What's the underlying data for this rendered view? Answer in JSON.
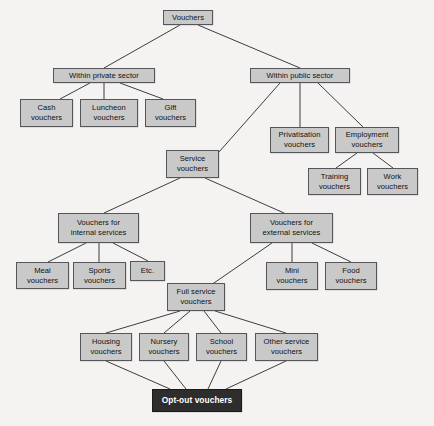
{
  "diagram": {
    "type": "tree-diagram",
    "colors": {
      "background": "#f4f3f1",
      "node_fill": "#c9c9c9",
      "node_border": "#55565a",
      "node_text": "#101010",
      "highlight_fill": "#2e2d2d",
      "highlight_text": "#ffffff",
      "edge": "#3d3d3d"
    },
    "nodes": [
      {
        "id": "vouchers",
        "label": "Vouchers",
        "x": 163,
        "y": 10,
        "w": 50,
        "h": 15,
        "style": "default"
      },
      {
        "id": "private",
        "label": "Within private sector",
        "x": 53,
        "y": 68,
        "w": 102,
        "h": 15,
        "style": "default"
      },
      {
        "id": "public",
        "label": "Within public sector",
        "x": 250,
        "y": 68,
        "w": 100,
        "h": 15,
        "style": "default"
      },
      {
        "id": "cash",
        "label": "Cash\nvouchers",
        "x": 20,
        "y": 99,
        "w": 53,
        "h": 28,
        "style": "default"
      },
      {
        "id": "luncheon",
        "label": "Luncheon\nvouchers",
        "x": 80,
        "y": 99,
        "w": 58,
        "h": 28,
        "style": "default"
      },
      {
        "id": "gift",
        "label": "Gift\nvouchers",
        "x": 145,
        "y": 99,
        "w": 51,
        "h": 28,
        "style": "default"
      },
      {
        "id": "privatisation",
        "label": "Privatisation\nvouchers",
        "x": 270,
        "y": 127,
        "w": 59,
        "h": 26,
        "style": "default"
      },
      {
        "id": "employment",
        "label": "Employment\nvouchers",
        "x": 335,
        "y": 127,
        "w": 64,
        "h": 26,
        "style": "default"
      },
      {
        "id": "training",
        "label": "Training\nvouchers",
        "x": 308,
        "y": 168,
        "w": 53,
        "h": 27,
        "style": "default"
      },
      {
        "id": "work",
        "label": "Work\nvouchers",
        "x": 367,
        "y": 168,
        "w": 51,
        "h": 27,
        "style": "default"
      },
      {
        "id": "service",
        "label": "Service\nvouchers",
        "x": 166,
        "y": 150,
        "w": 53,
        "h": 28,
        "style": "default"
      },
      {
        "id": "internal",
        "label": "Vouchers for\ninternal services",
        "x": 58,
        "y": 213,
        "w": 81,
        "h": 30,
        "style": "default"
      },
      {
        "id": "external",
        "label": "Vouchers for\nexternal services",
        "x": 250,
        "y": 213,
        "w": 83,
        "h": 30,
        "style": "default"
      },
      {
        "id": "meal",
        "label": "Meal\nvouchers",
        "x": 16,
        "y": 262,
        "w": 53,
        "h": 27,
        "style": "default"
      },
      {
        "id": "sports",
        "label": "Sports\nvouchers",
        "x": 73,
        "y": 262,
        "w": 53,
        "h": 27,
        "style": "default"
      },
      {
        "id": "etc",
        "label": "Etc.",
        "x": 130,
        "y": 261,
        "w": 35,
        "h": 20,
        "style": "default"
      },
      {
        "id": "mini",
        "label": "Mini\nvouchers",
        "x": 266,
        "y": 262,
        "w": 52,
        "h": 28,
        "style": "default"
      },
      {
        "id": "food",
        "label": "Food\nvouchers",
        "x": 325,
        "y": 262,
        "w": 52,
        "h": 28,
        "style": "default"
      },
      {
        "id": "fullservice",
        "label": "Full service\nvouchers",
        "x": 167,
        "y": 283,
        "w": 58,
        "h": 28,
        "style": "default"
      },
      {
        "id": "housing",
        "label": "Housing\nvouchers",
        "x": 80,
        "y": 333,
        "w": 52,
        "h": 28,
        "style": "default"
      },
      {
        "id": "nursery",
        "label": "Nursery\nvouchers",
        "x": 139,
        "y": 333,
        "w": 50,
        "h": 28,
        "style": "default"
      },
      {
        "id": "school",
        "label": "School\nvouchers",
        "x": 196,
        "y": 333,
        "w": 51,
        "h": 28,
        "style": "default"
      },
      {
        "id": "otherservice",
        "label": "Other service\nvouchers",
        "x": 255,
        "y": 333,
        "w": 63,
        "h": 28,
        "style": "default"
      },
      {
        "id": "optout",
        "label": "Opt-out vouchers",
        "x": 152,
        "y": 389,
        "w": 90,
        "h": 23,
        "style": "highlight"
      }
    ],
    "edges": [
      {
        "from": "vouchers",
        "to": "private",
        "x1": 180,
        "y1": 25,
        "x2": 104,
        "y2": 68
      },
      {
        "from": "vouchers",
        "to": "public",
        "x1": 198,
        "y1": 25,
        "x2": 300,
        "y2": 68
      },
      {
        "from": "private",
        "to": "cash",
        "x1": 90,
        "y1": 83,
        "x2": 60,
        "y2": 99
      },
      {
        "from": "private",
        "to": "luncheon",
        "x1": 104,
        "y1": 83,
        "x2": 104,
        "y2": 99
      },
      {
        "from": "private",
        "to": "gift",
        "x1": 120,
        "y1": 83,
        "x2": 163,
        "y2": 99
      },
      {
        "from": "public",
        "to": "service",
        "x1": 280,
        "y1": 83,
        "x2": 219,
        "y2": 152
      },
      {
        "from": "public",
        "to": "privatisation",
        "x1": 300,
        "y1": 83,
        "x2": 300,
        "y2": 127
      },
      {
        "from": "public",
        "to": "employment",
        "x1": 318,
        "y1": 83,
        "x2": 363,
        "y2": 127
      },
      {
        "from": "employment",
        "to": "training",
        "x1": 357,
        "y1": 153,
        "x2": 336,
        "y2": 168
      },
      {
        "from": "employment",
        "to": "work",
        "x1": 373,
        "y1": 153,
        "x2": 393,
        "y2": 168
      },
      {
        "from": "service",
        "to": "internal",
        "x1": 180,
        "y1": 178,
        "x2": 104,
        "y2": 213
      },
      {
        "from": "service",
        "to": "external",
        "x1": 205,
        "y1": 178,
        "x2": 284,
        "y2": 213
      },
      {
        "from": "internal",
        "to": "meal",
        "x1": 86,
        "y1": 243,
        "x2": 48,
        "y2": 262
      },
      {
        "from": "internal",
        "to": "sports",
        "x1": 99,
        "y1": 243,
        "x2": 99,
        "y2": 262
      },
      {
        "from": "internal",
        "to": "etc",
        "x1": 113,
        "y1": 243,
        "x2": 148,
        "y2": 261
      },
      {
        "from": "external",
        "to": "fullservice",
        "x1": 272,
        "y1": 243,
        "x2": 211,
        "y2": 285
      },
      {
        "from": "external",
        "to": "mini",
        "x1": 292,
        "y1": 243,
        "x2": 292,
        "y2": 262
      },
      {
        "from": "external",
        "to": "food",
        "x1": 312,
        "y1": 243,
        "x2": 351,
        "y2": 262
      },
      {
        "from": "fullservice",
        "to": "housing",
        "x1": 180,
        "y1": 311,
        "x2": 106,
        "y2": 333
      },
      {
        "from": "fullservice",
        "to": "nursery",
        "x1": 190,
        "y1": 311,
        "x2": 164,
        "y2": 333
      },
      {
        "from": "fullservice",
        "to": "school",
        "x1": 204,
        "y1": 311,
        "x2": 221,
        "y2": 333
      },
      {
        "from": "fullservice",
        "to": "otherservice",
        "x1": 215,
        "y1": 311,
        "x2": 286,
        "y2": 333
      },
      {
        "from": "housing",
        "to": "optout",
        "x1": 106,
        "y1": 361,
        "x2": 170,
        "y2": 389
      },
      {
        "from": "nursery",
        "to": "optout",
        "x1": 164,
        "y1": 361,
        "x2": 186,
        "y2": 389
      },
      {
        "from": "school",
        "to": "optout",
        "x1": 221,
        "y1": 361,
        "x2": 208,
        "y2": 389
      },
      {
        "from": "otherservice",
        "to": "optout",
        "x1": 286,
        "y1": 361,
        "x2": 226,
        "y2": 389
      }
    ]
  }
}
